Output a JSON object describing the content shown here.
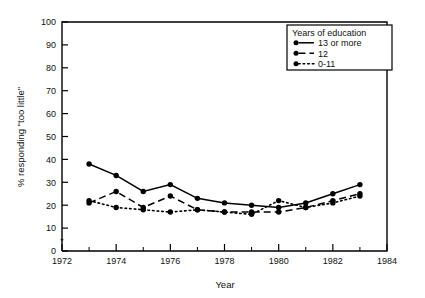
{
  "chart_data": {
    "type": "line",
    "title": "",
    "xlabel": "Year",
    "ylabel": "% responding \"too little\"",
    "xlim": [
      1972,
      1984
    ],
    "ylim": [
      0,
      100
    ],
    "xticks": [
      1972,
      1974,
      1976,
      1978,
      1980,
      1982,
      1984
    ],
    "xtick_labels": [
      "1972",
      "1974",
      "1976",
      "1978",
      "1980",
      "1982",
      "1984"
    ],
    "xminor_ticks": [
      1973,
      1975,
      1977,
      1979,
      1981,
      1983
    ],
    "yticks": [
      0,
      10,
      20,
      30,
      40,
      50,
      60,
      70,
      80,
      90,
      100
    ],
    "ytick_labels": [
      "0",
      "10",
      "20",
      "30",
      "40",
      "50",
      "60",
      "70",
      "80",
      "90",
      "100"
    ],
    "grid": false,
    "legend_position": "upper-right",
    "legend_title": "Years of education",
    "x": [
      1973,
      1974,
      1975,
      1976,
      1977,
      1978,
      1979,
      1980,
      1981,
      1982,
      1983
    ],
    "series": [
      {
        "name": "13 or more",
        "style": "solid",
        "marker": "filled-circle",
        "color": "#000000",
        "values": [
          38,
          33,
          26,
          29,
          23,
          21,
          20,
          19,
          21,
          25,
          29
        ]
      },
      {
        "name": "12",
        "style": "dashed",
        "marker": "filled-circle",
        "color": "#000000",
        "values": [
          21,
          26,
          19,
          24,
          18,
          17,
          17,
          17,
          19,
          22,
          25
        ]
      },
      {
        "name": "0-11",
        "style": "dotted",
        "marker": "filled-circle",
        "color": "#000000",
        "values": [
          22,
          19,
          18,
          17,
          18,
          17,
          16,
          22,
          19,
          21,
          24
        ]
      }
    ],
    "annotations": [
      {
        "name": "asterisk-marker",
        "symbol": "*",
        "x": 1972,
        "y": 5
      }
    ]
  },
  "axes": {
    "y_label": "% responding \"too little\"",
    "x_label": "Year"
  },
  "legend": {
    "title": "Years of education",
    "items": [
      {
        "label": "13 or more",
        "style": "solid"
      },
      {
        "label": "12",
        "style": "dashed"
      },
      {
        "label": "0-11",
        "style": "dotted"
      }
    ]
  }
}
